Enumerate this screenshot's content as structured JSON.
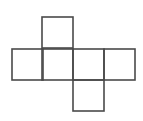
{
  "diagram": {
    "type": "cube-net",
    "stroke_color": "#4a4a4a",
    "background": "#ffffff",
    "cell_size": 31,
    "squares": [
      {
        "id": "top",
        "x": 42,
        "y": 17
      },
      {
        "id": "row-1",
        "x": 12,
        "y": 49
      },
      {
        "id": "row-2",
        "x": 42,
        "y": 49
      },
      {
        "id": "row-3",
        "x": 73,
        "y": 49
      },
      {
        "id": "row-4",
        "x": 104,
        "y": 49
      },
      {
        "id": "bottom",
        "x": 73,
        "y": 80
      }
    ]
  }
}
